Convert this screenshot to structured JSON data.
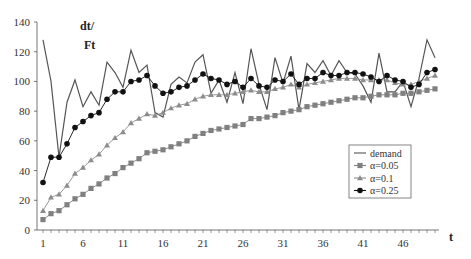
{
  "chart_data": {
    "type": "line",
    "title": "",
    "xlabel": "t",
    "ylabel": "dt/Ft",
    "ylabel_parts": {
      "line1": "dt/",
      "line2": "Ft"
    },
    "ylim": [
      0,
      140
    ],
    "xlim": [
      1,
      50
    ],
    "yticks": [
      0,
      20,
      40,
      60,
      80,
      100,
      120,
      140
    ],
    "xticks": [
      1,
      6,
      11,
      16,
      21,
      26,
      31,
      36,
      41,
      46
    ],
    "grid": false,
    "legend_position": "right-inside",
    "x": [
      1,
      2,
      3,
      4,
      5,
      6,
      7,
      8,
      9,
      10,
      11,
      12,
      13,
      14,
      15,
      16,
      17,
      18,
      19,
      20,
      21,
      22,
      23,
      24,
      25,
      26,
      27,
      28,
      29,
      30,
      31,
      32,
      33,
      34,
      35,
      36,
      37,
      38,
      39,
      40,
      41,
      42,
      43,
      44,
      45,
      46,
      47,
      48,
      49,
      50
    ],
    "series": [
      {
        "name": "demand",
        "marker": "none",
        "color": "#555555",
        "values": [
          128,
          100,
          49,
          86,
          101,
          83,
          93,
          84,
          113,
          106,
          96,
          121,
          106,
          111,
          79,
          76,
          98,
          103,
          99,
          113,
          118,
          92,
          101,
          86,
          106,
          85,
          122,
          98,
          81,
          116,
          99,
          117,
          81,
          112,
          106,
          114,
          104,
          114,
          106,
          105,
          97,
          86,
          119,
          93,
          93,
          100,
          83,
          102,
          128,
          116
        ]
      },
      {
        "name": "α=0.05",
        "marker": "square",
        "color": "#808080",
        "values": [
          7,
          11,
          13,
          17,
          21,
          24,
          28,
          31,
          35,
          38,
          42,
          45,
          48,
          52,
          53,
          54,
          56,
          58,
          60,
          63,
          65,
          67,
          68,
          69,
          70,
          71,
          75,
          75,
          76,
          77,
          79,
          80,
          81,
          83,
          84,
          85,
          86,
          87,
          88,
          89,
          89,
          90,
          91,
          91,
          91,
          92,
          92,
          93,
          94,
          95
        ]
      },
      {
        "name": "α=0.1",
        "marker": "triangle",
        "color": "#8c8c8c",
        "values": [
          13,
          22,
          24,
          30,
          38,
          42,
          47,
          51,
          57,
          62,
          66,
          72,
          75,
          78,
          77,
          79,
          82,
          84,
          85,
          88,
          90,
          91,
          91,
          91,
          92,
          93,
          94,
          93,
          93,
          95,
          96,
          98,
          96,
          98,
          99,
          100,
          101,
          102,
          102,
          102,
          101,
          101,
          101,
          101,
          99,
          98,
          98,
          100,
          102,
          104
        ]
      },
      {
        "name": "α=0.25",
        "marker": "circle",
        "color": "#111111",
        "values": [
          32,
          49,
          49,
          58,
          69,
          73,
          77,
          79,
          88,
          93,
          93,
          100,
          101,
          104,
          97,
          92,
          93,
          96,
          97,
          101,
          105,
          102,
          101,
          98,
          100,
          96,
          102,
          97,
          96,
          101,
          100,
          105,
          98,
          102,
          102,
          106,
          104,
          104,
          106,
          106,
          105,
          103,
          100,
          104,
          101,
          100,
          96,
          98,
          106,
          108
        ]
      }
    ]
  },
  "legend": {
    "items": [
      {
        "label": "demand"
      },
      {
        "label": "α=0.05"
      },
      {
        "label": "α=0.1"
      },
      {
        "label": "α=0.25"
      }
    ]
  }
}
